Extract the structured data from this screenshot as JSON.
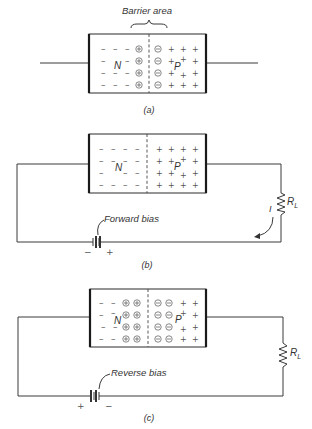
{
  "figure": {
    "panels": [
      {
        "id": "a",
        "caption": "(a)",
        "annotation": "Barrier area",
        "n_label": "N",
        "p_label": "P",
        "has_circuit": false
      },
      {
        "id": "b",
        "caption": "(b)",
        "n_label": "N",
        "p_label": "P",
        "has_circuit": true,
        "bias_label": "Forward bias",
        "battery_left_sign": "−",
        "battery_right_sign": "+",
        "resistor_label": "R",
        "resistor_subscript": "L",
        "current_label": "I"
      },
      {
        "id": "c",
        "caption": "(c)",
        "n_label": "N",
        "p_label": "P",
        "has_circuit": true,
        "bias_label": "Reverse bias",
        "battery_left_sign": "+",
        "battery_right_sign": "−",
        "resistor_label": "R",
        "resistor_subscript": "L"
      }
    ]
  }
}
